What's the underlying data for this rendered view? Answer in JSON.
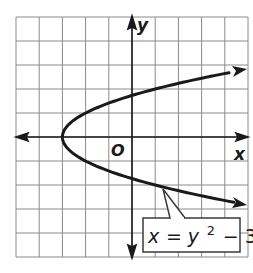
{
  "chart_data": {
    "type": "line",
    "title": "",
    "xlabel": "x",
    "ylabel": "y",
    "origin_label": "O",
    "xlim": [
      -5.0,
      5.0
    ],
    "ylim": [
      -5.0,
      5.0
    ],
    "grid": true,
    "grid_step": 1,
    "tick_labels": false,
    "series": [
      {
        "name": "x = y^2 - 3",
        "equation": "x = y² − 3",
        "vertex": [
          -3,
          0
        ],
        "points": [
          {
            "x": 5,
            "y": 2.83
          },
          {
            "x": 1,
            "y": 2
          },
          {
            "x": -2,
            "y": 1
          },
          {
            "x": -3,
            "y": 0
          },
          {
            "x": -2,
            "y": -1
          },
          {
            "x": 1,
            "y": -2
          },
          {
            "x": 5,
            "y": -2.83
          }
        ],
        "arrows_at_ends": true
      }
    ],
    "annotations": [
      {
        "text": "x = y² − 3",
        "type": "callout",
        "points_to": [
          1.3,
          -2.1
        ]
      }
    ]
  },
  "labels": {
    "x_axis": "x",
    "y_axis": "y",
    "origin": "O",
    "eq_x": "x",
    "eq_eq": "=",
    "eq_y": "y",
    "eq_exp": "2",
    "eq_rest": "− 3"
  },
  "colors": {
    "grid": "#8a8a8a",
    "axis": "#1a1a1a",
    "curve": "#1a1a1a",
    "background": "#ffffff"
  }
}
